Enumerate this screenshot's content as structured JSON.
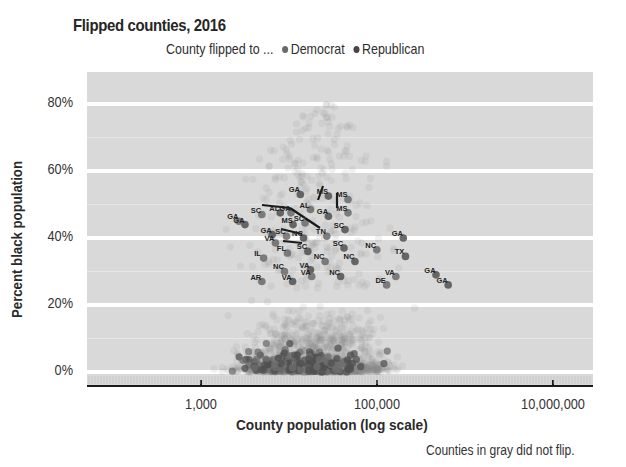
{
  "chart_data": {
    "type": "scatter",
    "title": "Flipped counties, 2016",
    "legend": {
      "prefix": "County flipped to ...",
      "entries": [
        {
          "name": "Democrat",
          "color": "#707070"
        },
        {
          "name": "Republican",
          "color": "#454545"
        }
      ],
      "position": "top"
    },
    "xlabel": "County population (log scale)",
    "ylabel": "Percent black population",
    "x_scale": "log",
    "xlim": [
      80,
      30000000
    ],
    "ylim": [
      -0.02,
      0.86
    ],
    "x_ticks": [
      {
        "value": 1000,
        "label": "1,000"
      },
      {
        "value": 100000,
        "label": "100,000"
      },
      {
        "value": 10000000,
        "label": "10,000,000"
      }
    ],
    "y_ticks": [
      {
        "value": 0.0,
        "label": "0%"
      },
      {
        "value": 0.2,
        "label": "20%"
      },
      {
        "value": 0.4,
        "label": "40%"
      },
      {
        "value": 0.6,
        "label": "60%"
      },
      {
        "value": 0.8,
        "label": "80%"
      }
    ],
    "grid": true,
    "background": "#d9d9d9",
    "gridline_color": "#ffffff",
    "note": "Counties in gray did not flip.",
    "series": [
      {
        "name": "Did not flip",
        "color": "#b0b0b0",
        "description": "thousands of translucent gray points, dense at 0-20% black population and 2,000-300,000 population"
      },
      {
        "name": "Democrat",
        "color": "#707070"
      },
      {
        "name": "Republican",
        "color": "#454545"
      }
    ],
    "labeled_points": [
      {
        "label": "GA",
        "pop": 2300,
        "pct": 0.465
      },
      {
        "label": "GA",
        "pop": 2700,
        "pct": 0.455
      },
      {
        "label": "SC",
        "pop": 4200,
        "pct": 0.485
      },
      {
        "label": "AL",
        "pop": 6800,
        "pct": 0.49
      },
      {
        "label": "GA",
        "pop": 9000,
        "pct": 0.49
      },
      {
        "label": "GA",
        "pop": 11500,
        "pct": 0.545
      },
      {
        "label": "AL",
        "pop": 15000,
        "pct": 0.5
      },
      {
        "label": "MS",
        "pop": 9500,
        "pct": 0.455
      },
      {
        "label": "SC",
        "pop": 13000,
        "pct": 0.46
      },
      {
        "label": "MS",
        "pop": 24000,
        "pct": 0.54
      },
      {
        "label": "MS",
        "pop": 40000,
        "pct": 0.53
      },
      {
        "label": "GA",
        "pop": 24000,
        "pct": 0.48
      },
      {
        "label": "MS",
        "pop": 40000,
        "pct": 0.49
      },
      {
        "label": "GA",
        "pop": 5500,
        "pct": 0.425
      },
      {
        "label": "SC",
        "pop": 8000,
        "pct": 0.42
      },
      {
        "label": "NC",
        "pop": 12500,
        "pct": 0.415
      },
      {
        "label": "TN",
        "pop": 23000,
        "pct": 0.42
      },
      {
        "label": "SC",
        "pop": 37000,
        "pct": 0.44
      },
      {
        "label": "VA",
        "pop": 6000,
        "pct": 0.4
      },
      {
        "label": "SC",
        "pop": 36000,
        "pct": 0.385
      },
      {
        "label": "NC",
        "pop": 85000,
        "pct": 0.38
      },
      {
        "label": "GA",
        "pop": 170000,
        "pct": 0.415
      },
      {
        "label": "FL",
        "pop": 8200,
        "pct": 0.37
      },
      {
        "label": "SC",
        "pop": 14000,
        "pct": 0.375
      },
      {
        "label": "IL",
        "pop": 4400,
        "pct": 0.355
      },
      {
        "label": "TX",
        "pop": 180000,
        "pct": 0.36
      },
      {
        "label": "NC",
        "pop": 22000,
        "pct": 0.345
      },
      {
        "label": "NC",
        "pop": 48000,
        "pct": 0.345
      },
      {
        "label": "NC",
        "pop": 7600,
        "pct": 0.315
      },
      {
        "label": "VA",
        "pop": 15000,
        "pct": 0.32
      },
      {
        "label": "VA",
        "pop": 15500,
        "pct": 0.3
      },
      {
        "label": "NC",
        "pop": 33000,
        "pct": 0.3
      },
      {
        "label": "VA",
        "pop": 140000,
        "pct": 0.3
      },
      {
        "label": "GA",
        "pop": 400000,
        "pct": 0.305
      },
      {
        "label": "AR",
        "pop": 4200,
        "pct": 0.285
      },
      {
        "label": "VA",
        "pop": 9400,
        "pct": 0.285
      },
      {
        "label": "DE",
        "pop": 110000,
        "pct": 0.275
      },
      {
        "label": "GA",
        "pop": 550000,
        "pct": 0.275
      }
    ]
  }
}
